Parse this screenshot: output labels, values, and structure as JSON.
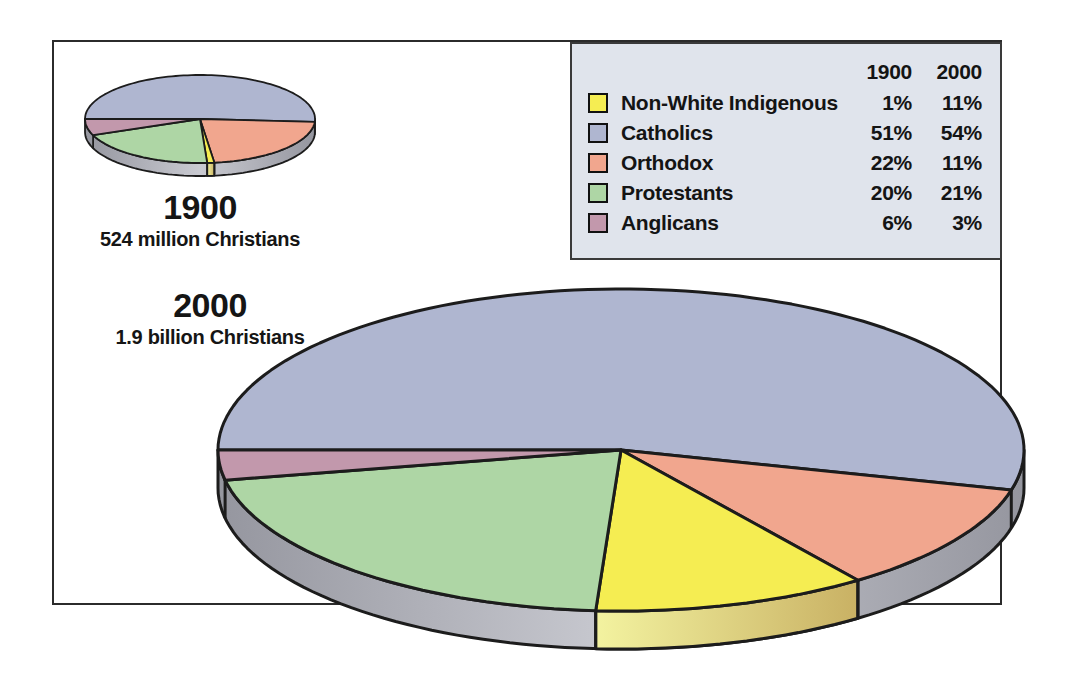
{
  "chart_data": {
    "type": "pie",
    "unit": "%",
    "categories": [
      "Non-White Indigenous",
      "Catholics",
      "Orthodox",
      "Protestants",
      "Anglicans"
    ],
    "colors": {
      "Non-White Indigenous": "#f5ed52",
      "Catholics": "#afb6d0",
      "Orthodox": "#f1a68e",
      "Protestants": "#aed6a5",
      "Anglicans": "#c298ac"
    },
    "series": [
      {
        "name": "1900",
        "caption": "524 million Christians",
        "values": {
          "Non-White Indigenous": 1,
          "Catholics": 51,
          "Orthodox": 22,
          "Protestants": 20,
          "Anglicans": 6
        }
      },
      {
        "name": "2000",
        "caption": "1.9 billion Christians",
        "values": {
          "Non-White Indigenous": 11,
          "Catholics": 54,
          "Orthodox": 11,
          "Protestants": 21,
          "Anglicans": 3
        }
      }
    ],
    "slice_draw_order": [
      "Catholics",
      "Orthodox",
      "Non-White Indigenous",
      "Protestants",
      "Anglicans"
    ],
    "start_angle_deg": 180,
    "direction": "clockwise",
    "legend_position": "top-right",
    "style": {
      "outline": "#1c1c1c",
      "rim_gray_edge": "#95969f",
      "rim_gray_mid": "#c9cad1",
      "yellow_side_light": "#f3f3a0",
      "yellow_side_dark": "#c9b164",
      "legend_bg": "#e0e4ec",
      "frame_border": "#2b2b2b"
    }
  }
}
